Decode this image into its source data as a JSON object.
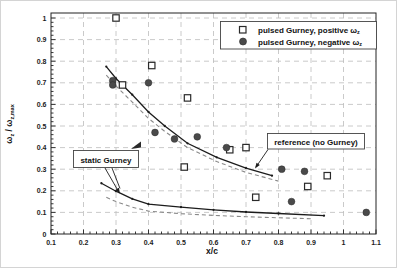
{
  "colors": {
    "background": "#ffffff",
    "frame": "#222222",
    "grid": "#bcbcbc",
    "solid_line": "#1c1c1c",
    "dashed_line": "#8a8a8a",
    "marker_fill": "#4a4a4a",
    "square_stroke": "#2a2a2a"
  },
  "axes": {
    "xlabel": "x/c",
    "ylabel_parts": {
      "b1": "ω",
      "s1": "z",
      "b2": " / ω",
      "s2": "z,max"
    },
    "x_ticks": [
      0.1,
      0.2,
      0.3,
      0.4,
      0.5,
      0.6,
      0.7,
      0.8,
      0.9,
      1.0,
      1.1
    ],
    "x_tick_labels": [
      "0.1",
      "0.2",
      "0.3",
      "0.4",
      "0.5",
      "0.6",
      "0.7",
      "0.8",
      "0.9",
      "1",
      "1.1"
    ],
    "y_ticks": [
      0,
      0.1,
      0.2,
      0.3,
      0.4,
      0.5,
      0.6,
      0.7,
      0.8,
      0.9,
      1.0
    ],
    "y_tick_labels": [
      "0",
      "0.1",
      "0.2",
      "0.3",
      "0.4",
      "0.5",
      "0.6",
      "0.7",
      "0.8",
      "0.9",
      "1"
    ]
  },
  "legend": {
    "items": [
      {
        "marker": "open-square",
        "label": "pulsed Gurney, positive ω",
        "sub": "z"
      },
      {
        "marker": "filled-circle",
        "label": "pulsed Gurney, negative ω",
        "sub": "z"
      }
    ]
  },
  "annotations": {
    "static_label": "static Gurney",
    "reference_label": "reference (no Gurney)"
  },
  "chart_data": {
    "type": "scatter",
    "title": "",
    "xlabel": "x/c",
    "ylabel": "ω_z / ω_z,max",
    "xlim": [
      0.1,
      1.1
    ],
    "ylim": [
      0,
      1
    ],
    "grid": true,
    "legend_position": "top-right",
    "series": [
      {
        "name": "pulsed Gurney, positive ω_z",
        "marker": "open-square",
        "points": [
          [
            0.3,
            1.0
          ],
          [
            0.41,
            0.78
          ],
          [
            0.32,
            0.69
          ],
          [
            0.52,
            0.63
          ],
          [
            0.51,
            0.31
          ],
          [
            0.65,
            0.39
          ],
          [
            0.7,
            0.4
          ],
          [
            0.73,
            0.17
          ],
          [
            0.89,
            0.22
          ],
          [
            0.95,
            0.27
          ]
        ]
      },
      {
        "name": "pulsed Gurney, negative ω_z",
        "marker": "filled-circle",
        "points": [
          [
            0.29,
            0.71
          ],
          [
            0.29,
            0.69
          ],
          [
            0.4,
            0.7
          ],
          [
            0.42,
            0.47
          ],
          [
            0.48,
            0.44
          ],
          [
            0.55,
            0.45
          ],
          [
            0.64,
            0.4
          ],
          [
            0.81,
            0.3
          ],
          [
            0.88,
            0.29
          ],
          [
            0.84,
            0.15
          ],
          [
            1.07,
            0.1
          ]
        ]
      },
      {
        "name": "reference (no Gurney), solid",
        "style": "solid-line",
        "points": [
          [
            0.27,
            0.775
          ],
          [
            0.3,
            0.72
          ],
          [
            0.35,
            0.645
          ],
          [
            0.4,
            0.565
          ],
          [
            0.45,
            0.5
          ],
          [
            0.52,
            0.42
          ],
          [
            0.61,
            0.355
          ],
          [
            0.7,
            0.305
          ],
          [
            0.78,
            0.27
          ]
        ]
      },
      {
        "name": "reference (no Gurney), dashed",
        "style": "dashed-line",
        "points": [
          [
            0.27,
            0.735
          ],
          [
            0.3,
            0.685
          ],
          [
            0.35,
            0.61
          ],
          [
            0.4,
            0.535
          ],
          [
            0.45,
            0.475
          ],
          [
            0.52,
            0.4
          ],
          [
            0.61,
            0.335
          ],
          [
            0.7,
            0.285
          ],
          [
            0.8,
            0.245
          ]
        ]
      },
      {
        "name": "static Gurney, solid",
        "style": "solid-line",
        "points": [
          [
            0.255,
            0.235
          ],
          [
            0.3,
            0.198
          ],
          [
            0.35,
            0.163
          ],
          [
            0.4,
            0.138
          ],
          [
            0.5,
            0.124
          ],
          [
            0.6,
            0.112
          ],
          [
            0.7,
            0.102
          ],
          [
            0.8,
            0.095
          ],
          [
            0.94,
            0.085
          ]
        ]
      },
      {
        "name": "static Gurney, dashed",
        "style": "dashed-line",
        "points": [
          [
            0.27,
            0.17
          ],
          [
            0.3,
            0.15
          ],
          [
            0.35,
            0.124
          ],
          [
            0.4,
            0.106
          ],
          [
            0.5,
            0.094
          ],
          [
            0.6,
            0.086
          ],
          [
            0.7,
            0.08
          ],
          [
            0.8,
            0.075
          ],
          [
            0.9,
            0.071
          ]
        ]
      }
    ]
  }
}
